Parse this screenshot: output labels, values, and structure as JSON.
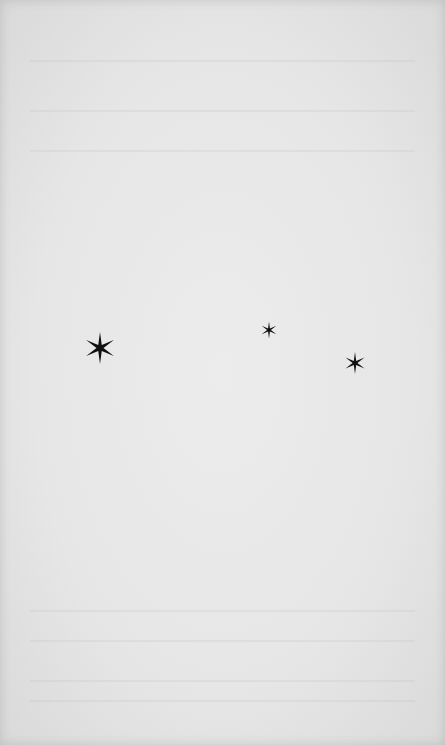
{
  "document": {
    "type": "printed page",
    "text_content": "",
    "ornament": {
      "kind": "asterism",
      "glyph": "six-pointed star",
      "color": "#111111",
      "stars": [
        {
          "name": "star-left",
          "x": 100,
          "y": 348,
          "size": 32
        },
        {
          "name": "star-middle",
          "x": 269,
          "y": 330,
          "size": 17
        },
        {
          "name": "star-right",
          "x": 355,
          "y": 363,
          "size": 22
        }
      ]
    },
    "paper_color": "#e8e8e8"
  }
}
